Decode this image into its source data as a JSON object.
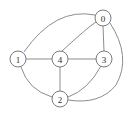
{
  "figure": {
    "width": 133,
    "height": 117,
    "background_color": "#ffffff",
    "edge_color": "#8c8c8c",
    "node_fill_color": "#ffffff",
    "node_stroke_color": "#7a7a7a",
    "label_color": "#2b2b2b"
  },
  "chart_data": {
    "type": "diagram",
    "diagram_type": "undirected-graph",
    "title": "",
    "node_count": 5,
    "edge_count": 9,
    "nodes": [
      {
        "id": "0",
        "label": "0",
        "x": 103,
        "y": 18,
        "r": 8
      },
      {
        "id": "1",
        "label": "1",
        "x": 18,
        "y": 59,
        "r": 8
      },
      {
        "id": "2",
        "label": "2",
        "x": 60,
        "y": 99,
        "r": 8
      },
      {
        "id": "3",
        "label": "3",
        "x": 104,
        "y": 59,
        "r": 8
      },
      {
        "id": "4",
        "label": "4",
        "x": 60,
        "y": 59,
        "r": 8
      }
    ],
    "edges": [
      {
        "source": "1",
        "target": "0",
        "style": "curved",
        "path": "M 24 52 Q 55 7 95 15"
      },
      {
        "source": "4",
        "target": "0",
        "style": "curved",
        "path": "M 62 51 Q 88 27 96 22"
      },
      {
        "source": "0",
        "target": "3",
        "style": "straight",
        "path": "M 103 26 L 104 51"
      },
      {
        "source": "0",
        "target": "2",
        "style": "curved",
        "path": "M 110 23 Q 132 57 116 85 Q 100 105 68 100"
      },
      {
        "source": "1",
        "target": "4",
        "style": "straight",
        "path": "M 26 59 L 52 59"
      },
      {
        "source": "4",
        "target": "3",
        "style": "straight",
        "path": "M 68 59 L 96 59"
      },
      {
        "source": "4",
        "target": "2",
        "style": "straight",
        "path": "M 60 67 L 60 91"
      },
      {
        "source": "1",
        "target": "2",
        "style": "curved",
        "path": "M 21 67 Q 28 90 52 97"
      },
      {
        "source": "3",
        "target": "2",
        "style": "curved",
        "path": "M 101 66 Q 88 90 68 97"
      }
    ],
    "adjacency": {
      "0": [
        "1",
        "2",
        "3",
        "4"
      ],
      "1": [
        "0",
        "2",
        "4"
      ],
      "2": [
        "0",
        "1",
        "3",
        "4"
      ],
      "3": [
        "0",
        "2",
        "4"
      ],
      "4": [
        "0",
        "1",
        "2",
        "3"
      ]
    }
  }
}
